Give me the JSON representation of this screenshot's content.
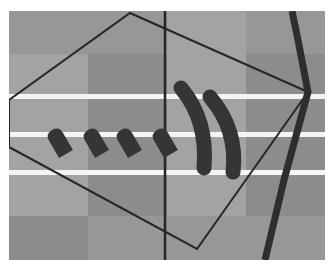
{
  "map": {
    "frame": {
      "x": 9,
      "y": 11,
      "width": 316,
      "height": 249
    },
    "colors": {
      "background": "#ffffff",
      "tile_dark": "#8c8c8c",
      "tile_mid": "#979797",
      "tile_light": "#a3a3a3",
      "stripe": "#f4f4f4",
      "ink": "#262626",
      "road": "#2e2e2e",
      "blob": "#353535"
    },
    "tiles": [
      {
        "x": 9,
        "y": 11,
        "w": 79,
        "h": 43,
        "shade": "tile_mid"
      },
      {
        "x": 88,
        "y": 11,
        "w": 79,
        "h": 43,
        "shade": "tile_mid"
      },
      {
        "x": 167,
        "y": 11,
        "w": 79,
        "h": 43,
        "shade": "tile_light"
      },
      {
        "x": 246,
        "y": 11,
        "w": 79,
        "h": 43,
        "shade": "tile_mid"
      },
      {
        "x": 9,
        "y": 54,
        "w": 79,
        "h": 162,
        "shade": "tile_light"
      },
      {
        "x": 88,
        "y": 54,
        "w": 79,
        "h": 162,
        "shade": "tile_dark"
      },
      {
        "x": 167,
        "y": 54,
        "w": 79,
        "h": 162,
        "shade": "tile_light"
      },
      {
        "x": 246,
        "y": 54,
        "w": 79,
        "h": 162,
        "shade": "tile_dark"
      },
      {
        "x": 9,
        "y": 216,
        "w": 79,
        "h": 44,
        "shade": "tile_dark"
      },
      {
        "x": 88,
        "y": 216,
        "w": 79,
        "h": 44,
        "shade": "tile_mid"
      },
      {
        "x": 167,
        "y": 216,
        "w": 79,
        "h": 44,
        "shade": "tile_mid"
      },
      {
        "x": 246,
        "y": 216,
        "w": 79,
        "h": 44,
        "shade": "tile_mid"
      }
    ],
    "stripes": [
      {
        "y": 94,
        "h": 5
      },
      {
        "y": 132,
        "h": 5
      },
      {
        "y": 170,
        "h": 5
      }
    ],
    "vertical_line": {
      "x": 165,
      "y1": 11,
      "y2": 260,
      "width": 2.5
    },
    "polygon": {
      "points": "9,100 130,13 308,92 197,249 9,147",
      "stroke_width": 2
    },
    "road": {
      "points": "292,11 298,40 308,92 284,180 265,260",
      "width": 7
    },
    "dashes": [
      {
        "cx": 59,
        "cy": 142,
        "angle": 30
      },
      {
        "cx": 95,
        "cy": 142,
        "angle": 30
      },
      {
        "cx": 128,
        "cy": 142,
        "angle": 30
      },
      {
        "cx": 164,
        "cy": 142,
        "angle": 30
      }
    ],
    "arcs": [
      {
        "d": "M 181 88 Q 208 120 204 168"
      },
      {
        "d": "M 210 97 Q 238 130 233 172"
      }
    ]
  }
}
